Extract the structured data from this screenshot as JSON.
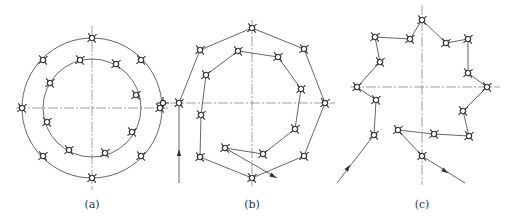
{
  "labels": [
    {
      "text": "(a)",
      "x": 92,
      "y": 198
    },
    {
      "text": "(b)",
      "x": 252,
      "y": 198
    },
    {
      "text": "(c)",
      "x": 422,
      "y": 198
    }
  ],
  "figure_a": {
    "center": [
      92,
      108
    ],
    "outer_radius": 70,
    "inner_radius": 49,
    "centerlines": {
      "h": [
        16,
        168,
        108
      ],
      "v": [
        92,
        26,
        190
      ]
    },
    "outer_points": [
      [
        92,
        38
      ],
      [
        141,
        60
      ],
      [
        160,
        108
      ],
      [
        141,
        156
      ],
      [
        92,
        178
      ],
      [
        43,
        156
      ],
      [
        22,
        108
      ],
      [
        43,
        60
      ]
    ],
    "inner_points": [
      [
        80,
        60
      ],
      [
        116,
        64
      ],
      [
        136,
        95
      ],
      [
        132,
        132
      ],
      [
        105,
        153
      ],
      [
        69,
        150
      ],
      [
        47,
        122
      ],
      [
        50,
        83
      ]
    ]
  },
  "figure_b": {
    "centerlines": {
      "h": [
        170,
        335,
        103
      ],
      "v": [
        252,
        20,
        186
      ]
    },
    "outer_path": [
      [
        179,
        103
      ],
      [
        200,
        50
      ],
      [
        252,
        28
      ],
      [
        304,
        49
      ],
      [
        325,
        103
      ],
      [
        304,
        156
      ],
      [
        252,
        178
      ],
      [
        200,
        157
      ],
      [
        201,
        115
      ]
    ],
    "inner_path": [
      [
        201,
        115
      ],
      [
        206,
        75
      ],
      [
        238,
        51
      ],
      [
        278,
        57
      ],
      [
        301,
        89
      ],
      [
        295,
        129
      ],
      [
        263,
        154
      ],
      [
        225,
        148
      ],
      [
        277,
        178
      ]
    ],
    "entry_line": [
      [
        179,
        183
      ],
      [
        179,
        103
      ]
    ],
    "entry_arrow": [
      179,
      153
    ],
    "side_marker": [
      163,
      103
    ],
    "outer_points": [
      [
        179,
        103
      ],
      [
        200,
        50
      ],
      [
        252,
        28
      ],
      [
        304,
        49
      ],
      [
        325,
        103
      ],
      [
        304,
        156
      ],
      [
        252,
        178
      ],
      [
        200,
        157
      ]
    ],
    "inner_points": [
      [
        201,
        115
      ],
      [
        206,
        75
      ],
      [
        238,
        51
      ],
      [
        278,
        57
      ],
      [
        301,
        89
      ],
      [
        295,
        129
      ],
      [
        263,
        154
      ],
      [
        225,
        148
      ]
    ]
  },
  "figure_c": {
    "centerlines": {
      "h": [
        350,
        500,
        87
      ],
      "v": [
        422,
        5,
        185
      ]
    },
    "path": [
      [
        337,
        183
      ],
      [
        374,
        135
      ],
      [
        376,
        100
      ],
      [
        357,
        87
      ],
      [
        380,
        62
      ],
      [
        375,
        37
      ],
      [
        410,
        39
      ],
      [
        422,
        20
      ],
      [
        446,
        43
      ],
      [
        468,
        39
      ],
      [
        468,
        73
      ],
      [
        487,
        87
      ],
      [
        463,
        111
      ],
      [
        469,
        136
      ],
      [
        434,
        134
      ],
      [
        398,
        130
      ],
      [
        422,
        156
      ],
      [
        465,
        183
      ]
    ],
    "entry_arrow": [
      348,
      168
    ],
    "exit_arrow": [
      445,
      171
    ],
    "points": [
      [
        374,
        135
      ],
      [
        376,
        100
      ],
      [
        357,
        87
      ],
      [
        380,
        62
      ],
      [
        375,
        37
      ],
      [
        410,
        39
      ],
      [
        422,
        20
      ],
      [
        446,
        43
      ],
      [
        468,
        39
      ],
      [
        468,
        73
      ],
      [
        487,
        87
      ],
      [
        463,
        111
      ],
      [
        469,
        136
      ],
      [
        434,
        134
      ],
      [
        398,
        130
      ],
      [
        422,
        156
      ]
    ]
  }
}
